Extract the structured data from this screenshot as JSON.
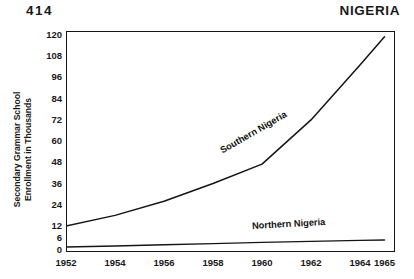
{
  "header": {
    "folio": "414",
    "country": "NIGERIA"
  },
  "chart_data": {
    "type": "line",
    "title": "NIGERIA",
    "xlabel": "",
    "ylabel": "Secondary Grammar School Enrollment in Thousands",
    "ylabel_line1": "Secondary Grammar School",
    "ylabel_line2": "Enrollment in Thousands",
    "grid": false,
    "legend": "inline-labels",
    "x": [
      1952,
      1954,
      1956,
      1958,
      1960,
      1962,
      1964,
      1965
    ],
    "xtick_labels": [
      "1952",
      "1954",
      "1956",
      "1958",
      "1960",
      "1962",
      "1964",
      "1965"
    ],
    "xlim": [
      1952,
      1965
    ],
    "ytick_labels": [
      "120",
      "108",
      "96",
      "84",
      "72",
      "60",
      "48",
      "36",
      "24",
      "12",
      "6",
      "0"
    ],
    "ytick_values": [
      120,
      108,
      96,
      84,
      72,
      60,
      48,
      36,
      24,
      12,
      6,
      0
    ],
    "ylim": [
      0,
      120
    ],
    "y_axis_note": "scale compressed below 12; ticks at 0, 6, 12 then every 12",
    "series": [
      {
        "name": "Southern Nigeria",
        "label": "Southern Nigeria",
        "color": "#151515",
        "x": [
          1952,
          1954,
          1956,
          1958,
          1960,
          1962,
          1964,
          1965
        ],
        "values": [
          12,
          18,
          26,
          36,
          47,
          72,
          103,
          119
        ]
      },
      {
        "name": "Northern Nigeria",
        "label": "Northern Nigeria",
        "color": "#151515",
        "x": [
          1952,
          1954,
          1956,
          1958,
          1960,
          1962,
          1964,
          1965
        ],
        "values": [
          1.5,
          2.0,
          2.6,
          3.2,
          3.8,
          4.3,
          4.8,
          5.0
        ]
      }
    ]
  }
}
